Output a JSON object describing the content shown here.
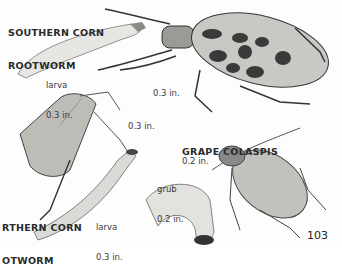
{
  "page": {
    "page_number": "103",
    "species": [
      {
        "name_line1": "SOUTHERN CORN",
        "name_line2": "ROOTWORM",
        "stages": [
          {
            "label": "larva",
            "size": "0.3 in."
          },
          {
            "label": "adult",
            "size": "0.3 in."
          }
        ]
      },
      {
        "name_line1": "RTHERN CORN",
        "name_line2": "OTWORM",
        "stages": [
          {
            "label": "adult",
            "size": "0.3 in."
          },
          {
            "label": "larva",
            "size": "0.3 in."
          }
        ]
      },
      {
        "name_line1": "GRAPE COLASPIS",
        "stages": [
          {
            "label": "adult",
            "size": "0.2 in."
          },
          {
            "label": "grub",
            "size": "0.2 in."
          }
        ]
      }
    ]
  }
}
